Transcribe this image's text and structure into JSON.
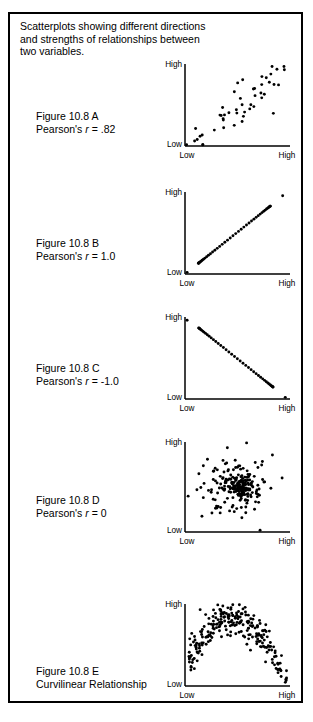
{
  "figure": {
    "header": "Scatterplots showing different directions\nand strengths of relationships between\ntwo variables.",
    "border_color": "#000000",
    "background_color": "#ffffff",
    "dot_color": "#000000",
    "axis_color": "#000000"
  },
  "axis_labels": {
    "y_high": "High",
    "y_low": "Low",
    "x_low": "Low",
    "x_high": "High"
  },
  "panels": [
    {
      "id": "A",
      "label_line1": "Figure 10.8 A",
      "label_prefix": "Pearson's ",
      "label_symbol": "r",
      "label_suffix": " = .82",
      "relationship": "strong positive",
      "r": 0.82,
      "top": 46,
      "label_top": 108,
      "plot_left": 183,
      "plot_top": 62,
      "plot_width": 105,
      "plot_height": 82
    },
    {
      "id": "B",
      "label_line1": "Figure 10.8 B",
      "label_prefix": "Pearson's ",
      "label_symbol": "r",
      "label_suffix": " = 1.0",
      "relationship": "perfect positive",
      "r": 1.0,
      "top": 172,
      "label_top": 235,
      "plot_left": 183,
      "plot_top": 190,
      "plot_width": 105,
      "plot_height": 82
    },
    {
      "id": "C",
      "label_line1": "Figure 10.8 C",
      "label_prefix": "Pearson's ",
      "label_symbol": "r",
      "label_suffix": " = -1.0",
      "relationship": "perfect negative",
      "r": -1.0,
      "top": 297,
      "label_top": 360,
      "plot_left": 183,
      "plot_top": 315,
      "plot_width": 105,
      "plot_height": 82
    },
    {
      "id": "D",
      "label_line1": "Figure 10.8 D",
      "label_prefix": "Pearson's ",
      "label_symbol": "r",
      "label_suffix": " = 0",
      "relationship": "no relationship",
      "r": 0,
      "top": 422,
      "label_top": 492,
      "plot_left": 183,
      "plot_top": 440,
      "plot_width": 105,
      "plot_height": 90
    },
    {
      "id": "E",
      "label_line1": "Figure 10.8 E",
      "label_line2": "Curvilinear Relationship",
      "relationship": "curvilinear inverted-U",
      "top": 556,
      "label_top": 663,
      "plot_left": 183,
      "plot_top": 602,
      "plot_width": 105,
      "plot_height": 82
    }
  ],
  "chart_data": {
    "type": "scatter",
    "title": "Scatterplots showing different directions and strengths of relationships between two variables.",
    "xlabel": "",
    "ylabel": "",
    "xlim": [
      0,
      1
    ],
    "ylim": [
      0,
      1
    ],
    "xtick_labels": [
      "Low",
      "High"
    ],
    "ytick_labels": [
      "Low",
      "High"
    ],
    "grid": false,
    "legend": "none",
    "panels": [
      {
        "name": "Figure 10.8 A",
        "annotation": "Pearson's r = .82",
        "r": 0.82,
        "n_points": 48,
        "pattern": "strong-positive-linear-with-noise",
        "seed": 11,
        "noise": 0.17,
        "x_range": [
          0.03,
          0.95
        ],
        "y_range": [
          0.02,
          0.96
        ]
      },
      {
        "name": "Figure 10.8 B",
        "annotation": "Pearson's r = 1.0",
        "r": 1.0,
        "n_points": 42,
        "pattern": "perfect-positive-line",
        "seed": 0,
        "noise": 0,
        "x_range": [
          0.02,
          0.92
        ],
        "y_range": [
          0.02,
          0.95
        ]
      },
      {
        "name": "Figure 10.8 C",
        "annotation": "Pearson's r = -1.0",
        "r": -1.0,
        "n_points": 42,
        "pattern": "perfect-negative-line",
        "seed": 0,
        "noise": 0,
        "x_range": [
          0.02,
          0.95
        ],
        "y_range": [
          0.02,
          0.96
        ]
      },
      {
        "name": "Figure 10.8 D",
        "annotation": "Pearson's r = 0",
        "r": 0,
        "n_points": 235,
        "pattern": "gaussian-cloud",
        "seed": 7,
        "noise": 1,
        "center": [
          0.52,
          0.5
        ],
        "spread": 0.22
      },
      {
        "name": "Figure 10.8 E",
        "annotation": "Curvilinear Relationship",
        "r": 0,
        "n_points": 240,
        "pattern": "inverted-u-quadratic",
        "seed": 23,
        "noise": 0.1,
        "x_range": [
          0.03,
          0.97
        ],
        "peak_x": 0.45,
        "peak_y": 0.82
      }
    ]
  }
}
